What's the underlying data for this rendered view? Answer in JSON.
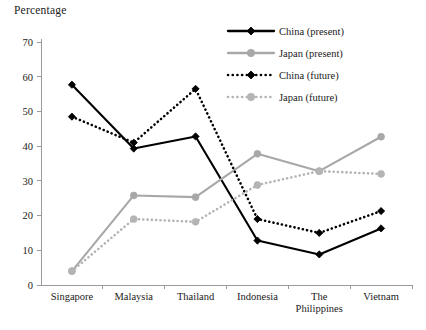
{
  "chart_data": {
    "type": "line",
    "title": "Percentage",
    "xlabel": "",
    "ylabel": "",
    "ylim": [
      0,
      70
    ],
    "yticks": [
      0,
      10,
      20,
      30,
      40,
      50,
      60,
      70
    ],
    "grid": false,
    "legend_position": "top-right",
    "categories": [
      "Singapore",
      "Malaysia",
      "Thailand",
      "Indonesia",
      "The Philippines",
      "Vietnam"
    ],
    "category_lines": [
      [
        "Singapore"
      ],
      [
        "Malaysia"
      ],
      [
        "Thailand"
      ],
      [
        "Indonesia"
      ],
      [
        "The",
        "Philippines"
      ],
      [
        "Vietnam"
      ]
    ],
    "series": [
      {
        "name": "China (present)",
        "color": "#000000",
        "style": "solid",
        "marker": "diamond",
        "values": [
          57.7,
          39.3,
          42.8,
          12.8,
          8.8,
          16.3
        ]
      },
      {
        "name": "Japan (present)",
        "color": "#a8a8a8",
        "style": "solid",
        "marker": "circle",
        "values": [
          4.0,
          25.8,
          25.3,
          37.8,
          32.8,
          42.7
        ]
      },
      {
        "name": "China (future)",
        "color": "#000000",
        "style": "dotted",
        "marker": "diamond",
        "values": [
          48.5,
          41.0,
          56.5,
          19.0,
          15.0,
          21.3
        ]
      },
      {
        "name": "Japan (future)",
        "color": "#b4b4b4",
        "style": "dotted",
        "marker": "circle",
        "values": [
          4.0,
          19.0,
          18.2,
          28.8,
          32.8,
          32.0
        ]
      }
    ]
  },
  "legend": {
    "entries": [
      {
        "label": "China (present)"
      },
      {
        "label": "Japan (present)"
      },
      {
        "label": "China (future)"
      },
      {
        "label": "Japan (future)"
      }
    ]
  },
  "axis": {
    "y_tick_labels": [
      "70",
      "60",
      "50",
      "40",
      "30",
      "20",
      "10",
      "0"
    ]
  }
}
